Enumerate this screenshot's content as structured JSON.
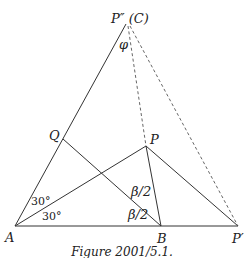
{
  "figure": {
    "caption": "Figure 2001/5.1.",
    "points": {
      "C": {
        "label": "P″ (C)",
        "x": 126,
        "y": 24
      },
      "A": {
        "label": "A",
        "x": 15,
        "y": 226
      },
      "B": {
        "label": "B",
        "x": 161,
        "y": 226
      },
      "P": {
        "label": "P",
        "x": 146,
        "y": 146
      },
      "P_prime": {
        "label": "P′",
        "x": 238,
        "y": 226
      },
      "Q": {
        "label": "Q",
        "x": 63,
        "y": 139
      }
    },
    "angles": {
      "phi": "φ",
      "a_upper": "30°",
      "a_lower": "30°",
      "b_upper": "β/2",
      "b_lower": "β/2"
    }
  }
}
